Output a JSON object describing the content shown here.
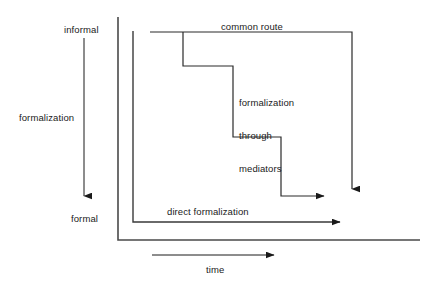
{
  "diagram": {
    "background_color": "#ffffff",
    "line_color": "#1a1a1a",
    "text_color": "#1a1a1a",
    "axes": {
      "vertical": {
        "label": "formalization",
        "top_label": "informal",
        "bottom_label": "formal",
        "direction": "downward",
        "arrow": true
      },
      "horizontal": {
        "label": "time",
        "direction": "rightward",
        "arrow": true
      }
    },
    "paths": [
      {
        "name": "common-route",
        "label": "common route",
        "description": "stepped descending path from informal to formal ending with downward arrow",
        "steps": 3,
        "arrow_end": "down"
      },
      {
        "name": "formalization-through-mediators",
        "label": "formalization\nthrough\nmediators",
        "label_lines": [
          "formalization",
          "through",
          "mediators"
        ],
        "description": "annotation for the stepped path",
        "arrow_end": "right"
      },
      {
        "name": "direct-formalization",
        "label": "direct formalization",
        "description": "straight horizontal path at the formal level",
        "arrow_end": "right"
      }
    ]
  },
  "labels": {
    "informal": "informal",
    "formalization": "formalization",
    "formal": "formal",
    "common_route": "common route",
    "mediators_line1": "formalization",
    "mediators_line2": "through",
    "mediators_line3": "mediators",
    "direct_formalization": "direct formalization",
    "time": "time"
  }
}
